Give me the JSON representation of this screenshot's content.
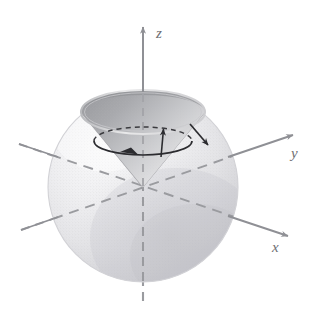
{
  "figure": {
    "background_color": "#ffffff"
  },
  "axes": {
    "z": {
      "label": "z",
      "label_x": 156,
      "label_y": 26,
      "color": "#8f9095",
      "style_above_origin": "solid",
      "style_below_origin": "dashed",
      "arrow": "up",
      "tip": {
        "x": 143,
        "y": 25
      },
      "tail": {
        "x": 143,
        "y": 306
      }
    },
    "y": {
      "label": "y",
      "label_x": 291,
      "label_y": 146,
      "color": "#8f9095",
      "style_front": "solid",
      "style_behind_sphere": "dashed",
      "arrow": "upper-right",
      "tip": {
        "x": 296,
        "y": 134
      },
      "tail": {
        "x": 21,
        "y": 230
      }
    },
    "x": {
      "label": "x",
      "label_x": 272,
      "label_y": 240,
      "color": "#8f9095",
      "style_front": "solid",
      "style_behind_sphere": "dashed",
      "arrow": "lower-right",
      "tip": {
        "x": 291,
        "y": 236
      },
      "tail": {
        "x": 19,
        "y": 144
      }
    }
  },
  "sphere": {
    "name": "shaded-sphere",
    "center_x": 143,
    "center_y": 187,
    "radius": 95,
    "fill_light": "#f4f4f5",
    "fill_mid": "#e2e2e4",
    "fill_shadow": "#cfcfd2",
    "edge_color": "#d8d8da"
  },
  "cone": {
    "name": "inverted-cone",
    "apex_x": 143,
    "apex_y": 187,
    "rim_center_x": 143,
    "rim_center_y": 112,
    "rim_rx": 62,
    "rim_ry": 22,
    "outer_fill": "#efeff0",
    "inner_fill_dark": "#a9aaad",
    "inner_fill_light": "#dcdcde",
    "edge_color": "#b8b8bb"
  },
  "annotations": {
    "precession_circle": {
      "name": "precession-circle",
      "center_x": 143,
      "center_y": 141,
      "rx": 49,
      "ry": 14,
      "front_style": "solid",
      "back_style": "dashed",
      "color": "#2b2b2f",
      "arrow_direction": "clockwise-viewed-from-above"
    },
    "up_vector": {
      "name": "up-vector-arrow",
      "from_x": 162,
      "from_y": 156,
      "to_x": 164,
      "to_y": 126,
      "color": "#2b2b2f"
    },
    "down_right_vector": {
      "name": "down-right-vector-arrow",
      "from_x": 190,
      "from_y": 124,
      "to_x": 210,
      "to_y": 148,
      "color": "#2b2b2f"
    }
  }
}
